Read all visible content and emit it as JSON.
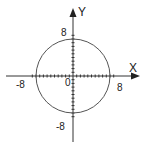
{
  "chart_data": {
    "type": "line",
    "title": "",
    "xlabel": "X",
    "ylabel": "Y",
    "xlim": [
      -11,
      11
    ],
    "ylim": [
      -11,
      11
    ],
    "grid": false,
    "x_tick_labels": [
      "-8",
      "8"
    ],
    "y_tick_labels": [
      "8",
      "-8"
    ],
    "origin_label": "0",
    "tick_step": 1,
    "series": [
      {
        "name": "circle",
        "shape": "circle",
        "center": [
          0,
          0
        ],
        "radius": 10,
        "equation": "x^2 + y^2 = 100"
      }
    ]
  },
  "labels": {
    "x_axis": "X",
    "y_axis": "Y",
    "origin": "0",
    "x_neg": "-8",
    "x_pos": "8",
    "y_pos": "8",
    "y_neg": "-8"
  },
  "colors": {
    "axis": "#333333",
    "circle": "#555555",
    "text": "#222222"
  }
}
